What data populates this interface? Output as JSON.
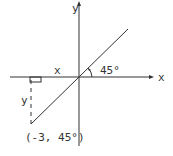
{
  "diagram": {
    "axes": {
      "x_label": "x",
      "y_label": "y"
    },
    "labels": {
      "horizontal_leg": "x",
      "vertical_leg": "y",
      "angle": "45°",
      "point": "(-3, 45°)"
    },
    "colors": {
      "stroke": "#333333",
      "background": "#ffffff"
    }
  }
}
